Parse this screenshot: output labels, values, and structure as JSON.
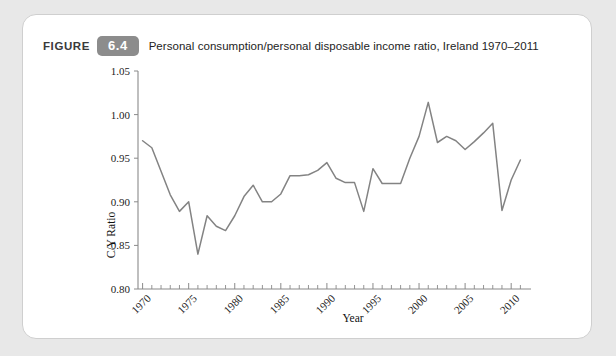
{
  "figure": {
    "label": "FIGURE",
    "number": "6.4",
    "caption": "Personal consumption/personal disposable income ratio, Ireland 1970–2011",
    "badge_color": "#8c8c8c",
    "line_color": "#838383",
    "card_background": "#ffffff",
    "page_background": "#e8e8e8"
  },
  "chart_data": {
    "type": "line",
    "title": "",
    "xlabel": "Year",
    "ylabel": "C/Y Ratio",
    "xlim": [
      1969.5,
      2011.5
    ],
    "ylim": [
      0.8,
      1.05
    ],
    "grid": false,
    "legend": null,
    "ytick_labels": [
      "1.05",
      "1.00",
      "0.95",
      "0.90",
      "0.85",
      "0.80"
    ],
    "ytick_values": [
      1.05,
      1.0,
      0.95,
      0.9,
      0.85,
      0.8
    ],
    "xtick_labels": [
      "1970",
      "1975",
      "1980",
      "1985",
      "1990",
      "1995",
      "2000",
      "2005",
      "2010"
    ],
    "xtick_values": [
      1970,
      1975,
      1980,
      1985,
      1990,
      1995,
      2000,
      2005,
      2010
    ],
    "x": [
      1970,
      1971,
      1972,
      1973,
      1974,
      1975,
      1976,
      1977,
      1978,
      1979,
      1980,
      1981,
      1982,
      1983,
      1984,
      1985,
      1986,
      1987,
      1988,
      1989,
      1990,
      1991,
      1992,
      1993,
      1994,
      1995,
      1996,
      1997,
      1998,
      1999,
      2000,
      2001,
      2002,
      2003,
      2004,
      2005,
      2006,
      2007,
      2008,
      2009,
      2010,
      2011
    ],
    "values": [
      0.97,
      0.962,
      0.935,
      0.908,
      0.889,
      0.9,
      0.84,
      0.884,
      0.872,
      0.867,
      0.884,
      0.906,
      0.919,
      0.9,
      0.9,
      0.909,
      0.93,
      0.93,
      0.931,
      0.936,
      0.945,
      0.927,
      0.922,
      0.922,
      0.889,
      0.938,
      0.921,
      0.921,
      0.921,
      0.95,
      0.975,
      1.014,
      0.968,
      0.975,
      0.97,
      0.96,
      0.969,
      0.979,
      0.99,
      0.89,
      0.925,
      0.948
    ],
    "series": [
      {
        "name": "C/Y Ratio",
        "values": [
          0.97,
          0.962,
          0.935,
          0.908,
          0.889,
          0.9,
          0.84,
          0.884,
          0.872,
          0.867,
          0.884,
          0.906,
          0.919,
          0.9,
          0.9,
          0.909,
          0.93,
          0.93,
          0.931,
          0.936,
          0.945,
          0.927,
          0.922,
          0.922,
          0.889,
          0.938,
          0.921,
          0.921,
          0.921,
          0.95,
          0.975,
          1.014,
          0.968,
          0.975,
          0.97,
          0.96,
          0.969,
          0.979,
          0.99,
          0.89,
          0.925,
          0.948
        ]
      }
    ]
  }
}
